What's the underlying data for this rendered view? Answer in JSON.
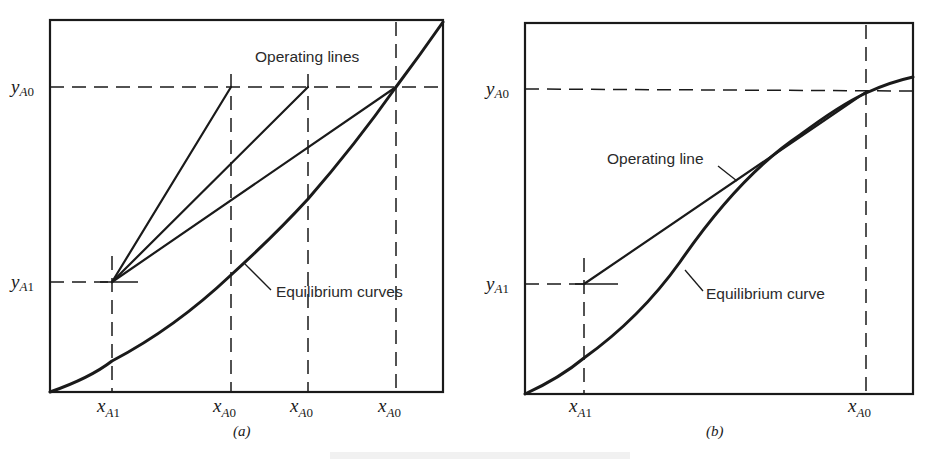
{
  "figure": {
    "panels": [
      {
        "id": "a",
        "caption": "(a)",
        "annotations": {
          "operating_lines": "Operating lines",
          "equilibrium_curves": "Equilibrium curves"
        },
        "y_labels": [
          {
            "var": "y",
            "sub": "A",
            "num": "0"
          },
          {
            "var": "y",
            "sub": "A",
            "num": "1"
          }
        ],
        "x_labels": [
          {
            "var": "x",
            "sub": "A",
            "num": "1"
          },
          {
            "var": "x",
            "sub": "A",
            "num": "0"
          },
          {
            "var": "x",
            "sub": "A",
            "num": "0"
          },
          {
            "var": "x",
            "sub": "A",
            "num": "0"
          }
        ]
      },
      {
        "id": "b",
        "caption": "(b)",
        "annotations": {
          "operating_line": "Operating line",
          "equilibrium_curve": "Equilibrium curve"
        },
        "y_labels": [
          {
            "var": "y",
            "sub": "A",
            "num": "0"
          },
          {
            "var": "y",
            "sub": "A",
            "num": "1"
          }
        ],
        "x_labels": [
          {
            "var": "x",
            "sub": "A",
            "num": "1"
          },
          {
            "var": "x",
            "sub": "A",
            "num": "0"
          }
        ]
      }
    ],
    "colors": {
      "ink": "#1a1a1a",
      "background": "#ffffff"
    }
  }
}
